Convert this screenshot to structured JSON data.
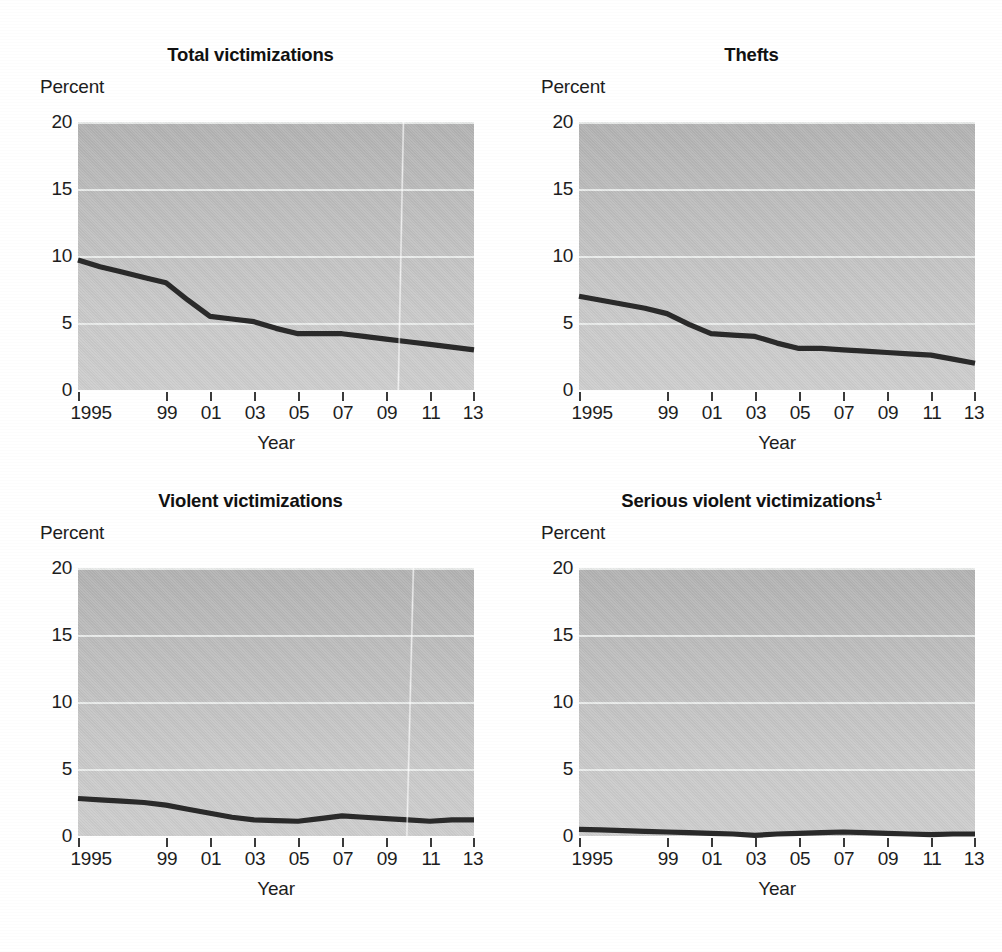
{
  "figure": {
    "panel_count": 4,
    "y_axis_unit_label": "Percent",
    "x_axis_title": "Year",
    "y_ticks": [
      "20",
      "15",
      "10",
      "5",
      "0"
    ],
    "x_ticks": [
      "1995",
      "99",
      "01",
      "03",
      "05",
      "07",
      "09",
      "11",
      "13"
    ],
    "colors": {
      "plot_background_top": "#b4b4b4",
      "plot_background_bottom": "#cfcfcf",
      "gridline": "#eef0ef",
      "series_line": "#2a2a2a",
      "text": "#1d1d1d",
      "page_background": "#ffffff"
    }
  },
  "panels": [
    {
      "id": "total-victimizations",
      "title": "Total victimizations",
      "title_superscript": "",
      "unit_label": "Percent",
      "x_axis_title": "Year"
    },
    {
      "id": "thefts",
      "title": "Thefts",
      "title_superscript": "",
      "unit_label": "Percent",
      "x_axis_title": "Year"
    },
    {
      "id": "violent-victimizations",
      "title": "Violent victimizations",
      "title_superscript": "",
      "unit_label": "Percent",
      "x_axis_title": "Year"
    },
    {
      "id": "serious-violent-victimizations",
      "title": "Serious violent victimizations",
      "title_superscript": "1",
      "unit_label": "Percent",
      "x_axis_title": "Year"
    }
  ],
  "chart_data": [
    {
      "type": "line",
      "title": "Total victimizations",
      "xlabel": "Year",
      "ylabel": "Percent",
      "xlim": [
        1995,
        2013
      ],
      "ylim": [
        0,
        20
      ],
      "yticks": [
        0,
        5,
        10,
        15,
        20
      ],
      "xticks": [
        1995,
        1999,
        2001,
        2003,
        2005,
        2007,
        2009,
        2011,
        2013
      ],
      "xticklabels": [
        "1995",
        "99",
        "01",
        "03",
        "05",
        "07",
        "09",
        "11",
        "13"
      ],
      "grid": "horizontal",
      "legend": "none",
      "x": [
        1995,
        1996,
        1997,
        1998,
        1999,
        2000,
        2001,
        2002,
        2003,
        2004,
        2005,
        2006,
        2007,
        2008,
        2009,
        2010,
        2011,
        2012,
        2013
      ],
      "values": [
        9.7,
        9.2,
        8.8,
        8.4,
        8.0,
        6.7,
        5.5,
        5.3,
        5.1,
        4.6,
        4.2,
        4.2,
        4.2,
        4.0,
        3.8,
        3.6,
        3.4,
        3.2,
        3.0
      ]
    },
    {
      "type": "line",
      "title": "Thefts",
      "xlabel": "Year",
      "ylabel": "Percent",
      "xlim": [
        1995,
        2013
      ],
      "ylim": [
        0,
        20
      ],
      "yticks": [
        0,
        5,
        10,
        15,
        20
      ],
      "xticks": [
        1995,
        1999,
        2001,
        2003,
        2005,
        2007,
        2009,
        2011,
        2013
      ],
      "xticklabels": [
        "1995",
        "99",
        "01",
        "03",
        "05",
        "07",
        "09",
        "11",
        "13"
      ],
      "grid": "horizontal",
      "legend": "none",
      "x": [
        1995,
        1996,
        1997,
        1998,
        1999,
        2000,
        2001,
        2002,
        2003,
        2004,
        2005,
        2006,
        2007,
        2008,
        2009,
        2010,
        2011,
        2012,
        2013
      ],
      "values": [
        7.0,
        6.7,
        6.4,
        6.1,
        5.7,
        4.9,
        4.2,
        4.1,
        4.0,
        3.5,
        3.1,
        3.1,
        3.0,
        2.9,
        2.8,
        2.7,
        2.6,
        2.3,
        2.0
      ]
    },
    {
      "type": "line",
      "title": "Violent victimizations",
      "xlabel": "Year",
      "ylabel": "Percent",
      "xlim": [
        1995,
        2013
      ],
      "ylim": [
        0,
        20
      ],
      "yticks": [
        0,
        5,
        10,
        15,
        20
      ],
      "xticks": [
        1995,
        1999,
        2001,
        2003,
        2005,
        2007,
        2009,
        2011,
        2013
      ],
      "xticklabels": [
        "1995",
        "99",
        "01",
        "03",
        "05",
        "07",
        "09",
        "11",
        "13"
      ],
      "grid": "horizontal",
      "legend": "none",
      "x": [
        1995,
        1996,
        1997,
        1998,
        1999,
        2000,
        2001,
        2002,
        2003,
        2004,
        2005,
        2006,
        2007,
        2008,
        2009,
        2010,
        2011,
        2012,
        2013
      ],
      "values": [
        2.8,
        2.7,
        2.6,
        2.5,
        2.3,
        2.0,
        1.7,
        1.4,
        1.2,
        1.15,
        1.1,
        1.3,
        1.5,
        1.4,
        1.3,
        1.2,
        1.1,
        1.2,
        1.2
      ]
    },
    {
      "type": "line",
      "title": "Serious violent victimizations",
      "title_superscript": "1",
      "xlabel": "Year",
      "ylabel": "Percent",
      "xlim": [
        1995,
        2013
      ],
      "ylim": [
        0,
        20
      ],
      "yticks": [
        0,
        5,
        10,
        15,
        20
      ],
      "xticks": [
        1995,
        1999,
        2001,
        2003,
        2005,
        2007,
        2009,
        2011,
        2013
      ],
      "xticklabels": [
        "1995",
        "99",
        "01",
        "03",
        "05",
        "07",
        "09",
        "11",
        "13"
      ],
      "grid": "horizontal",
      "legend": "none",
      "x": [
        1995,
        1996,
        1997,
        1998,
        1999,
        2000,
        2001,
        2002,
        2003,
        2004,
        2005,
        2006,
        2007,
        2008,
        2009,
        2010,
        2011,
        2012,
        2013
      ],
      "values": [
        0.5,
        0.45,
        0.4,
        0.35,
        0.3,
        0.25,
        0.2,
        0.15,
        0.05,
        0.15,
        0.2,
        0.25,
        0.3,
        0.25,
        0.2,
        0.15,
        0.1,
        0.15,
        0.15
      ]
    }
  ]
}
